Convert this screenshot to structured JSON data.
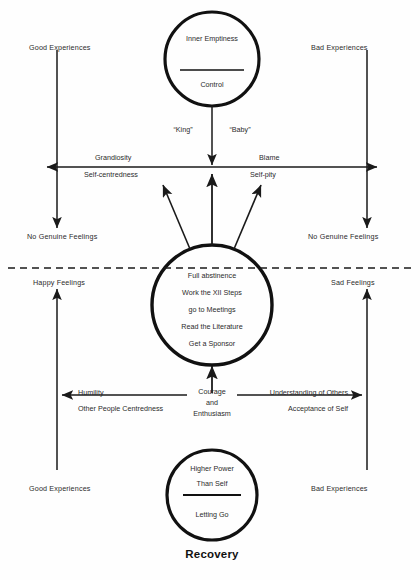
{
  "diagram": {
    "title": "Recovery",
    "top_circle": {
      "name": "inner-emptiness-control-circle",
      "above_divider": "Inner Emptiness",
      "below_divider": "Control"
    },
    "center_circle": {
      "name": "program-actions-circle",
      "lines": [
        "Full abstinence",
        "Work the XII Steps",
        "go to Meetings",
        "Read the Literature",
        "Get a Sponsor"
      ]
    },
    "bottom_circle": {
      "name": "higher-power-circle",
      "above_divider": [
        "Higher Power",
        "Than Self"
      ],
      "below_divider": "Letting Go"
    },
    "quotes": {
      "left": "“King”",
      "right": "“Baby”"
    },
    "upper_axis": {
      "left_above": "Grandiosity",
      "left_below": "Self-centredness",
      "right_above": "Blame",
      "right_below": "Self-pity"
    },
    "lower_axis": {
      "left_above": "Humility",
      "left_below": "Other People Centredness",
      "right_above": "Understanding of Others",
      "right_below": "Acceptance of Self",
      "center_stack": [
        "Courage",
        "and",
        "Enthusiasm"
      ]
    },
    "corner_labels": {
      "top_left": "Good Experiences",
      "top_right": "Bad Experiences",
      "mid_left_upper": "No Genuine Feelings",
      "mid_right_upper": "No Genuine Feelings",
      "mid_left_lower": "Happy Feelings",
      "mid_right_lower": "Sad Feelings",
      "bottom_left": "Good Experiences",
      "bottom_right": "Bad Experiences"
    },
    "colors": {
      "ink": "#1a1a1a",
      "text": "#2b2b2b",
      "background": "#fefefe"
    }
  }
}
